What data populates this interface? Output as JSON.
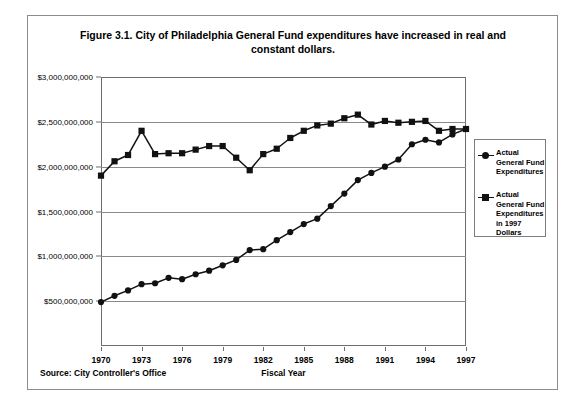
{
  "figure": {
    "title": "Figure 3.1. City of Philadelphia General Fund expenditures have increased in real and constant dollars.",
    "source": "Source: City Controller's Office",
    "xaxis_title": "Fiscal Year"
  },
  "legend": {
    "entries": [
      {
        "label": "Actual General Fund Expenditures",
        "marker": "circle",
        "color": "#111111"
      },
      {
        "label": "Actual General Fund Expenditures in 1997 Dollars",
        "marker": "square",
        "color": "#111111"
      }
    ]
  },
  "chart_data": {
    "type": "line",
    "title": "Figure 3.1. City of Philadelphia General Fund expenditures have increased in real and constant dollars.",
    "xlabel": "Fiscal Year",
    "ylabel": "",
    "grid": true,
    "legend_position": "right",
    "xlim": [
      1970,
      1997
    ],
    "ylim": [
      0,
      3000000000
    ],
    "ytick_labels": [
      "$3,000,000,000",
      "$2,500,000,000",
      "$2,000,000,000",
      "$1,500,000,000",
      "$1,000,000,000",
      "$500,000,000"
    ],
    "ytick_values": [
      3000000000,
      2500000000,
      2000000000,
      1500000000,
      1000000000,
      500000000
    ],
    "xtick_labels": [
      "1970",
      "1973",
      "1976",
      "1979",
      "1982",
      "1985",
      "1988",
      "1991",
      "1994",
      "1997"
    ],
    "xtick_values": [
      1970,
      1973,
      1976,
      1979,
      1982,
      1985,
      1988,
      1991,
      1994,
      1997
    ],
    "x": [
      1970,
      1971,
      1972,
      1973,
      1974,
      1975,
      1976,
      1977,
      1978,
      1979,
      1980,
      1981,
      1982,
      1983,
      1984,
      1985,
      1986,
      1987,
      1988,
      1989,
      1990,
      1991,
      1992,
      1993,
      1994,
      1995,
      1996,
      1997
    ],
    "series": [
      {
        "name": "Actual General Fund Expenditures",
        "marker": "circle",
        "color": "#111111",
        "values": [
          490000000,
          560000000,
          620000000,
          690000000,
          700000000,
          760000000,
          745000000,
          800000000,
          840000000,
          900000000,
          960000000,
          1070000000,
          1080000000,
          1180000000,
          1270000000,
          1360000000,
          1420000000,
          1560000000,
          1700000000,
          1850000000,
          1930000000,
          2000000000,
          2080000000,
          2250000000,
          2300000000,
          2270000000,
          2360000000,
          2420000000
        ]
      },
      {
        "name": "Actual General Fund Expenditures in 1997 Dollars",
        "marker": "square",
        "color": "#111111",
        "values": [
          1900000000,
          2060000000,
          2130000000,
          2400000000,
          2140000000,
          2150000000,
          2150000000,
          2190000000,
          2230000000,
          2230000000,
          2100000000,
          1960000000,
          2140000000,
          2200000000,
          2320000000,
          2400000000,
          2460000000,
          2480000000,
          2540000000,
          2580000000,
          2470000000,
          2510000000,
          2490000000,
          2500000000,
          2510000000,
          2400000000,
          2420000000,
          2420000000
        ]
      }
    ]
  }
}
